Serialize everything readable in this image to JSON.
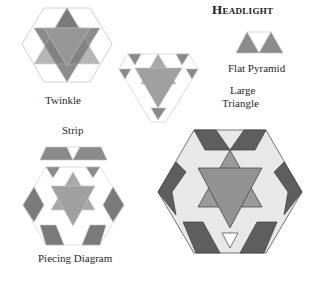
{
  "title": "Headlight",
  "labels": {
    "twinkle": "Twinkle",
    "large_triangle_line1": "Large",
    "large_triangle_line2": "Triangle",
    "flat_pyramid": "Flat Pyramid",
    "strip": "Strip",
    "piecing_diagram": "Piecing Diagram"
  },
  "colors": {
    "dark": "#6e6e6e",
    "medium": "#9a9a9a",
    "light": "#dcdcdc",
    "white": "#ffffff",
    "outline": "#bdbdbd"
  }
}
